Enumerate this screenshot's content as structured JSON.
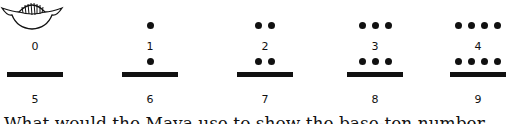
{
  "numerals": [
    {
      "value": "0",
      "symbol": "shell",
      "dots": 0,
      "bars": 0
    },
    {
      "value": "1",
      "symbol": "dots",
      "dots": 1,
      "bars": 0
    },
    {
      "value": "2",
      "symbol": "dots",
      "dots": 2,
      "bars": 0
    },
    {
      "value": "3",
      "symbol": "dots",
      "dots": 3,
      "bars": 0
    },
    {
      "value": "4",
      "symbol": "dots",
      "dots": 4,
      "bars": 0
    },
    {
      "value": "5",
      "symbol": "bar",
      "dots": 0,
      "bars": 1
    },
    {
      "value": "6",
      "symbol": "bar-dots",
      "dots": 1,
      "bars": 1
    },
    {
      "value": "7",
      "symbol": "bar-dots",
      "dots": 2,
      "bars": 1
    },
    {
      "value": "8",
      "symbol": "bar-dots",
      "dots": 3,
      "bars": 1
    },
    {
      "value": "9",
      "symbol": "bar-dots",
      "dots": 4,
      "bars": 1
    }
  ],
  "question": "What would the Maya use to show the base-ten number"
}
